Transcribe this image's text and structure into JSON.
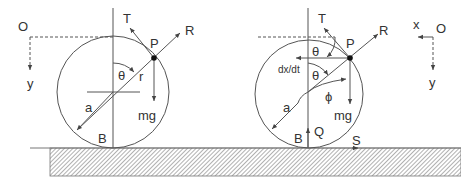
{
  "figure": {
    "left_diagram": {
      "labels": {
        "origin": "O",
        "y_axis": "y",
        "tension": "T",
        "reaction": "R",
        "point": "P",
        "angle": "θ",
        "radius_r": "r",
        "radius_a": "a",
        "weight": "mg",
        "bottom": "B"
      }
    },
    "right_diagram": {
      "labels": {
        "origin": "O",
        "x_axis": "x",
        "y_axis": "y",
        "tension": "T",
        "reaction": "R",
        "point": "P",
        "angle_top": "θ",
        "angle_mid": "θ",
        "velocity": "dx/dt",
        "phi": "ϕ",
        "radius_a": "a",
        "weight": "mg",
        "bottom": "B",
        "normal": "Q",
        "friction": "S"
      }
    },
    "colors": {
      "line": "#555555",
      "text": "#333333",
      "hatch": "#777777"
    }
  }
}
